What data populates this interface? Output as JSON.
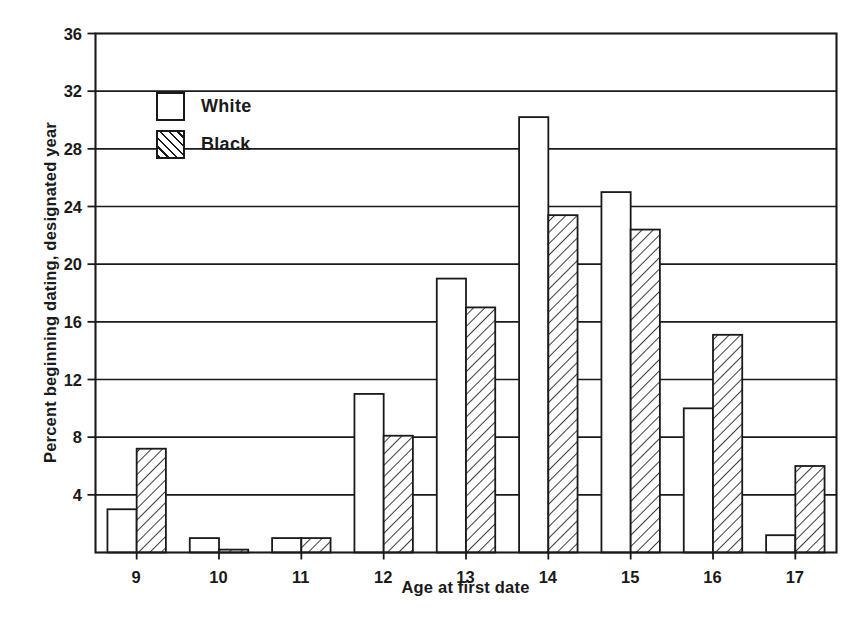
{
  "chart_data": {
    "type": "bar",
    "title": "",
    "xlabel": "Age at first date",
    "ylabel": "Percent beginning dating, designated year",
    "categories": [
      "9",
      "10",
      "11",
      "12",
      "13",
      "14",
      "15",
      "16",
      "17"
    ],
    "series": [
      {
        "name": "White",
        "values": [
          3.0,
          1.0,
          1.0,
          11.0,
          19.0,
          30.2,
          25.0,
          10.0,
          1.2
        ]
      },
      {
        "name": "Black",
        "values": [
          7.2,
          0.2,
          1.0,
          8.1,
          17.0,
          23.4,
          22.4,
          15.1,
          6.0
        ]
      }
    ],
    "ylim": [
      0,
      36
    ],
    "yticks": [
      4,
      8,
      12,
      16,
      20,
      24,
      28,
      32,
      36
    ],
    "ytick_labels": [
      "4",
      "8",
      "12",
      "16",
      "20",
      "24",
      "28",
      "32",
      "36"
    ],
    "grid": true,
    "grid_axis": "y",
    "legend_position": "upper-left-inside",
    "legend_entries": [
      "White",
      "Black"
    ],
    "styles": {
      "white_fill": "#ffffff",
      "black_fill_pattern": "diagonal-hatch",
      "line_color": "#1a1a1a",
      "background": "#ffffff"
    }
  },
  "axes": {
    "y_title": "Percent beginning dating, designated year",
    "x_title": "Age at first date"
  },
  "legend": {
    "white": {
      "label": "White",
      "swatch": "empty-square-swatch"
    },
    "black": {
      "label": "Black",
      "swatch": "hatched-square-swatch"
    }
  }
}
